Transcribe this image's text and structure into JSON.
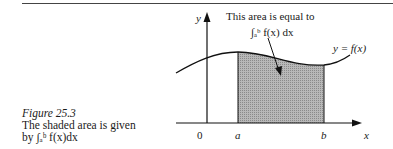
{
  "figure": {
    "caption_title": "Figure 25.3",
    "caption_line1": "The shaded area is given",
    "caption_line2": "by ∫ₐᵇ f(x)dx",
    "annotation_line1": "This area is equal to",
    "annotation_line2": "∫ₐᵇ f(x) dx",
    "curve_label": "y = f(x)",
    "axis_labels": {
      "y": "y",
      "x": "x"
    },
    "tick_labels": {
      "origin": "0",
      "a": "a",
      "b": "b"
    }
  }
}
